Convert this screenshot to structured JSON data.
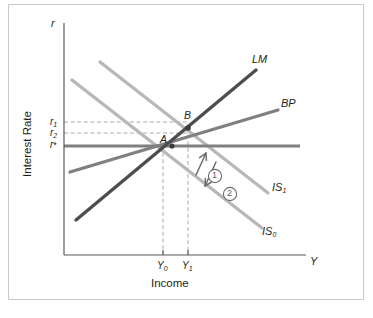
{
  "figure": {
    "type": "is-lm-bp-diagram",
    "axes": {
      "y_axis_symbol": "r",
      "y_axis_title": "Interest Rate",
      "x_axis_symbol": "Y",
      "x_axis_title": "Income"
    },
    "y_ticks": [
      {
        "name": "r1",
        "base": "r",
        "sub": "1",
        "y": 122
      },
      {
        "name": "r2",
        "base": "r",
        "sub": "2",
        "y": 133
      },
      {
        "name": "rstar",
        "base": "r",
        "sub": "*",
        "y": 146
      }
    ],
    "x_ticks": [
      {
        "name": "Y0",
        "base": "Y",
        "sub": "0",
        "x": 163
      },
      {
        "name": "Y1",
        "base": "Y",
        "sub": "1",
        "x": 188
      }
    ],
    "curves": [
      {
        "name": "IS0",
        "base": "IS",
        "sub": "0",
        "color": "#b8b8b8",
        "slope": "down"
      },
      {
        "name": "IS1",
        "base": "IS",
        "sub": "1",
        "color": "#b8b8b8",
        "slope": "down"
      },
      {
        "name": "LM",
        "base": "LM",
        "sub": "",
        "color": "#4d4d4d",
        "slope": "up-steep"
      },
      {
        "name": "BP",
        "base": "BP",
        "sub": "",
        "color": "#808080",
        "slope": "up-shallow"
      },
      {
        "name": "r-star-line",
        "base": "",
        "sub": "",
        "color": "#808080",
        "slope": "horizontal"
      }
    ],
    "points": [
      {
        "name": "A",
        "label": "A",
        "x": 172,
        "y": 146
      },
      {
        "name": "B",
        "label": "B",
        "x": 188,
        "y": 128
      }
    ],
    "annotations": [
      {
        "name": "step-1",
        "label": "1",
        "direction": "up-left"
      },
      {
        "name": "step-2",
        "label": "2",
        "direction": "down-left"
      }
    ],
    "colors": {
      "axis": "#58595b",
      "is_curve": "#b8b8b8",
      "lm_curve": "#4d4d4d",
      "bp_curve": "#808080",
      "rstar_line": "#808080",
      "dashed_guide": "#a0a0a0",
      "text": "#231f20",
      "frame": "#c9c9c9"
    }
  }
}
